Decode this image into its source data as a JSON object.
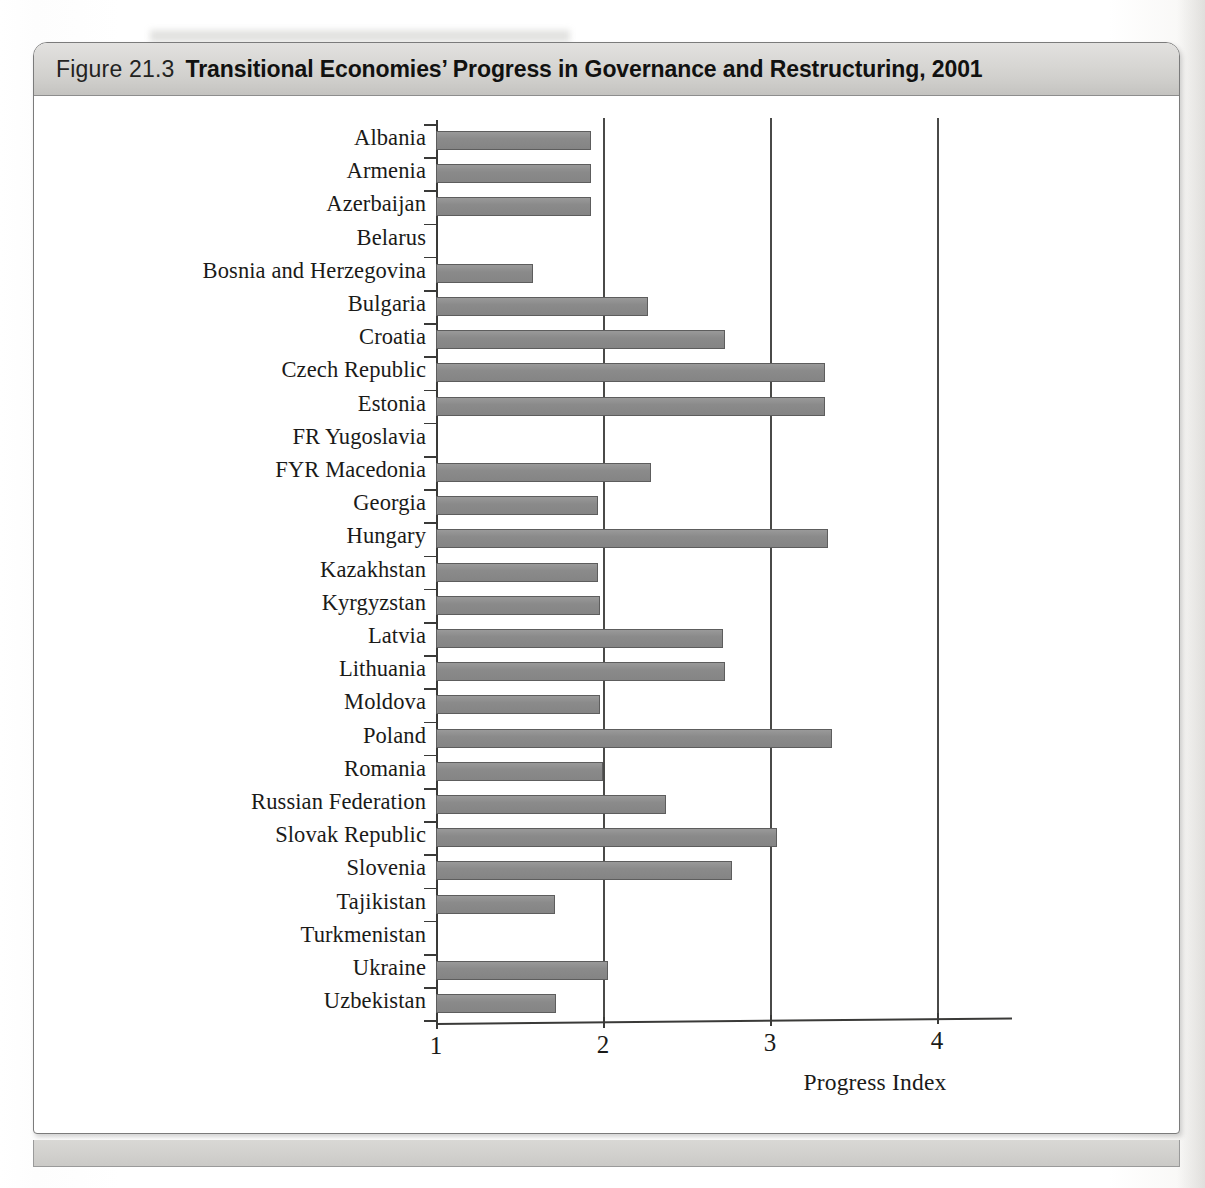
{
  "figure": {
    "number": "Figure 21.3",
    "title": "Transitional Economies’ Progress in Governance and Restructuring, 2001"
  },
  "axis": {
    "x_title": "Progress Index",
    "tick_labels": [
      "1",
      "2",
      "3",
      "4"
    ]
  },
  "chart_data": {
    "type": "bar",
    "orientation": "horizontal",
    "title": "Transitional Economies’ Progress in Governance and Restructuring, 2001",
    "xlabel": "Progress Index",
    "ylabel": "",
    "xlim": [
      1,
      4.4
    ],
    "xticks": [
      1,
      2,
      3,
      4
    ],
    "grid": "vertical gridlines at 2, 3, 4",
    "legend": "none",
    "bar_color": "#8d8d8d",
    "categories": [
      "Albania",
      "Armenia",
      "Azerbaijan",
      "Belarus",
      "Bosnia and Herzegovina",
      "Bulgaria",
      "Croatia",
      "Czech Republic",
      "Estonia",
      "FR Yugoslavia",
      "FYR Macedonia",
      "Georgia",
      "Hungary",
      "Kazakhstan",
      "Kyrgyzstan",
      "Latvia",
      "Lithuania",
      "Moldova",
      "Poland",
      "Romania",
      "Russian Federation",
      "Slovak Republic",
      "Slovenia",
      "Tajikistan",
      "Turkmenistan",
      "Ukraine",
      "Uzbekistan"
    ],
    "values": [
      1.93,
      1.93,
      1.93,
      1.0,
      1.58,
      2.27,
      2.73,
      3.33,
      3.33,
      1.0,
      2.29,
      1.97,
      3.35,
      1.97,
      1.98,
      2.72,
      2.73,
      1.98,
      3.37,
      2.0,
      2.38,
      3.04,
      2.77,
      1.71,
      1.0,
      2.03,
      1.72
    ]
  }
}
